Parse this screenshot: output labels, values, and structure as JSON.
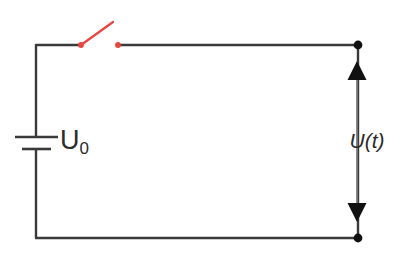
{
  "figure": {
    "kind": "electrical-circuit-diagram",
    "width": 400,
    "height": 255,
    "background_color": "#ffffff"
  },
  "colors": {
    "wire": "#3a3a3a",
    "switch": "#e8453c",
    "node": "#111111",
    "arrow": "#6e6e6e",
    "arrowhead": "#111111",
    "text": "#2b2b2b"
  },
  "labels": {
    "source_label": "U",
    "source_subscript": "0",
    "source_full": "U0",
    "measured_label": "U(t)"
  },
  "components": [
    {
      "name": "voltage-source",
      "type": "battery",
      "label": "U0",
      "position": {
        "x": 36,
        "y": 143
      },
      "long_plate": {
        "x1": 15,
        "x2": 58,
        "y": 137
      },
      "short_plate": {
        "x1": 22,
        "x2": 51,
        "y": 149
      }
    },
    {
      "name": "switch",
      "type": "spst-switch",
      "state": "open",
      "color": "#e8453c",
      "left_contact": {
        "x": 81,
        "y": 45
      },
      "right_contact": {
        "x": 118,
        "y": 45
      },
      "lever_tip": {
        "x": 113,
        "y": 22
      }
    },
    {
      "name": "voltage-measurement",
      "type": "double-headed-arrow",
      "label": "U(t)",
      "x": 357,
      "y_top": 62,
      "y_bottom": 221
    }
  ],
  "wires": [
    {
      "name": "top-left-wire",
      "x1": 36,
      "y1": 45,
      "x2": 81,
      "y2": 45
    },
    {
      "name": "top-right-wire",
      "x1": 118,
      "y1": 45,
      "x2": 358,
      "y2": 45
    },
    {
      "name": "left-rail-upper",
      "x1": 36,
      "y1": 45,
      "x2": 36,
      "y2": 137
    },
    {
      "name": "left-rail-lower",
      "x1": 36,
      "y1": 149,
      "x2": 36,
      "y2": 238
    },
    {
      "name": "bottom-wire",
      "x1": 36,
      "y1": 238,
      "x2": 358,
      "y2": 238
    },
    {
      "name": "right-rail",
      "x1": 358,
      "y1": 45,
      "x2": 358,
      "y2": 238
    }
  ],
  "nodes": [
    {
      "name": "node-top-right",
      "x": 358,
      "y": 45,
      "radius": 4.5
    },
    {
      "name": "node-bottom-right",
      "x": 358,
      "y": 238,
      "radius": 4.5
    }
  ]
}
